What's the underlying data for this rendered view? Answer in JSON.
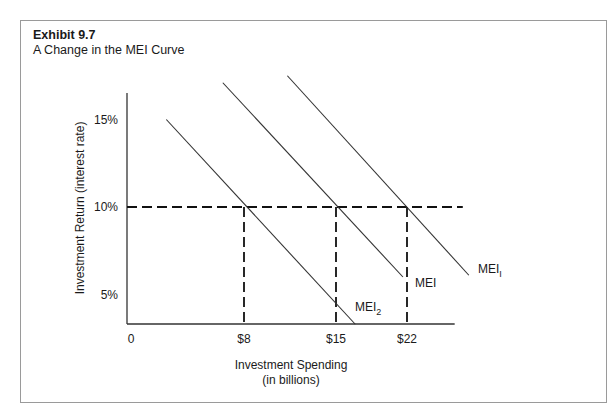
{
  "chart_data": {
    "type": "line",
    "title": "Exhibit 9.7",
    "subtitle": "A Change in the MEI Curve",
    "xlabel": "Investment Spending",
    "xlabel_sub": "(in billions)",
    "ylabel": "Investment Return (interest rate)",
    "x_ticks": [
      {
        "value": 0,
        "label": "0"
      },
      {
        "value": 8,
        "label": "$8"
      },
      {
        "value": 15,
        "label": "$15"
      },
      {
        "value": 22,
        "label": "$22"
      }
    ],
    "y_ticks": [
      {
        "value": 5,
        "label": "5%"
      },
      {
        "value": 10,
        "label": "10%"
      },
      {
        "value": 15,
        "label": "15%"
      }
    ],
    "xlim": [
      0,
      26.7
    ],
    "ylim": [
      3.3,
      19.5
    ],
    "grid": false,
    "series": [
      {
        "name": "MEI2",
        "label": "MEI",
        "label_sub": "2",
        "points": [
          [
            2.5,
            15.0
          ],
          [
            16.9,
            3.3
          ]
        ]
      },
      {
        "name": "MEI",
        "label": "MEI",
        "label_sub": "",
        "points": [
          [
            6.5,
            17.1
          ],
          [
            21.6,
            6.0
          ]
        ]
      },
      {
        "name": "MEI1",
        "label": "MEI",
        "label_sub": "I",
        "points": [
          [
            11.3,
            17.5
          ],
          [
            28.1,
            6.1
          ]
        ]
      }
    ],
    "reference_lines": {
      "horizontal": {
        "y": 10,
        "x_end": 27.5,
        "style": "dashed"
      },
      "vertical": [
        {
          "x": 8,
          "y_end": 10,
          "style": "dashed"
        },
        {
          "x": 15,
          "y_end": 10,
          "style": "dashed"
        },
        {
          "x": 22,
          "y_end": 10,
          "style": "dashed"
        }
      ]
    }
  }
}
